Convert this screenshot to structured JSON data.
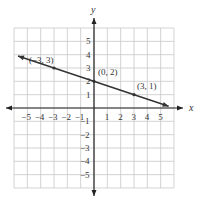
{
  "chart_data": {
    "type": "line",
    "title": "",
    "xlabel": "x",
    "ylabel": "y",
    "xlim": [
      -6,
      6
    ],
    "ylim": [
      -6,
      6
    ],
    "grid": true,
    "x_ticks": [
      "-5",
      "-4",
      "-3",
      "-2",
      "-1",
      "1",
      "2",
      "3",
      "4",
      "5"
    ],
    "y_ticks": [
      "5",
      "4",
      "3",
      "2",
      "1",
      "-1",
      "-2",
      "-3",
      "-4",
      "-5"
    ],
    "series": [
      {
        "name": "line",
        "x": [
          -3,
          0,
          3
        ],
        "y": [
          3,
          2,
          1
        ],
        "equation": "y = -x/3 + 2"
      }
    ],
    "annotations": [
      {
        "label": "(-3, 3)",
        "x": -3,
        "y": 3
      },
      {
        "label": "(0, 2)",
        "x": 0,
        "y": 2
      },
      {
        "label": "(3, 1)",
        "x": 3,
        "y": 1
      }
    ]
  }
}
